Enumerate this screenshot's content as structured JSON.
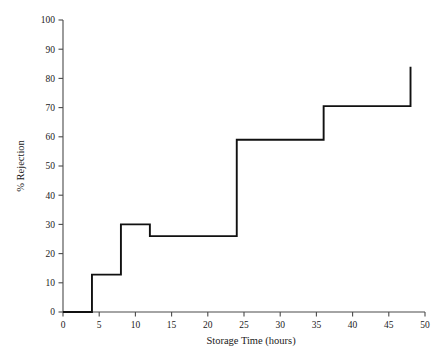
{
  "chart_data": {
    "type": "line",
    "title": "",
    "subtitle": "",
    "xlabel": "Storage Time (hours)",
    "ylabel": "% Rejection",
    "xlim": [
      0,
      50
    ],
    "ylim": [
      0,
      100
    ],
    "xticks": [
      0,
      5,
      10,
      15,
      20,
      25,
      30,
      35,
      40,
      45,
      50
    ],
    "xtick_labels": [
      "0",
      "5",
      "10",
      "15",
      "20",
      "25",
      "30",
      "35",
      "40",
      "45",
      "50"
    ],
    "yticks": [
      0,
      10,
      20,
      30,
      40,
      50,
      60,
      70,
      80,
      90,
      100
    ],
    "ytick_labels": [
      "0",
      "10",
      "20",
      "30",
      "40",
      "50",
      "60",
      "70",
      "80",
      "90",
      "100"
    ],
    "grid": false,
    "legend": false,
    "legend_position": "none",
    "drawstyle": "steps-post",
    "series": [
      {
        "name": "% Rejection",
        "color": "#111111",
        "x": [
          0,
          4,
          8,
          12,
          24,
          36,
          48
        ],
        "values": [
          0,
          12.8,
          30,
          26,
          59,
          70.5,
          84
        ]
      }
    ],
    "annotations": []
  },
  "axes": {
    "x_axis_name": "Storage Time (hours)",
    "y_axis_name": "% Rejection"
  }
}
